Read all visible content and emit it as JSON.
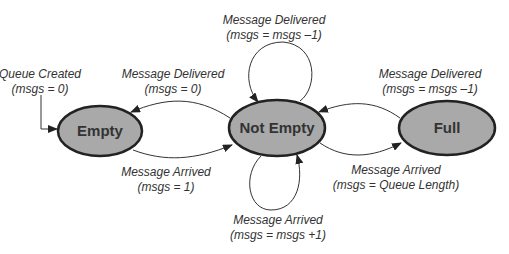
{
  "diagram": {
    "type": "state-machine",
    "colors": {
      "state_fill": "#a9a9a9",
      "state_stroke": "#222222",
      "edge": "#333333",
      "text": "#333333"
    },
    "states": [
      {
        "id": "empty",
        "label": "Empty"
      },
      {
        "id": "not_empty",
        "label": "Not Empty"
      },
      {
        "id": "full",
        "label": "Full"
      }
    ],
    "transitions": [
      {
        "id": "initial",
        "from": null,
        "to": "empty",
        "event": "Queue Created",
        "action": "(msgs = 0)"
      },
      {
        "id": "ne_to_empty",
        "from": "not_empty",
        "to": "empty",
        "event": "Message Delivered",
        "action": "(msgs = 0)"
      },
      {
        "id": "empty_to_ne",
        "from": "empty",
        "to": "not_empty",
        "event": "Message Arrived",
        "action": "(msgs = 1)"
      },
      {
        "id": "ne_loop_top",
        "from": "not_empty",
        "to": "not_empty",
        "event": "Message Delivered",
        "action": "(msgs = msgs –1)"
      },
      {
        "id": "ne_loop_bottom",
        "from": "not_empty",
        "to": "not_empty",
        "event": "Message Arrived",
        "action": "(msgs = msgs +1)"
      },
      {
        "id": "full_to_ne",
        "from": "full",
        "to": "not_empty",
        "event": "Message Delivered",
        "action": "(msgs = msgs –1)"
      },
      {
        "id": "ne_to_full",
        "from": "not_empty",
        "to": "full",
        "event": "Message Arrived",
        "action": "(msgs = Queue Length)"
      }
    ]
  }
}
